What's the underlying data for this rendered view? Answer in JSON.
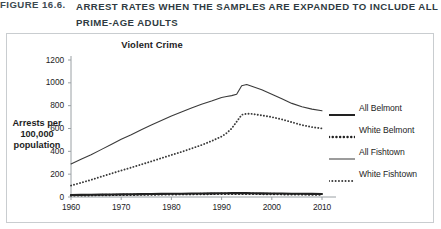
{
  "caption": {
    "label": "FIGURE 16.6.",
    "text": "ARREST RATES WHEN THE SAMPLES ARE EXPANDED TO INCLUDE ALL PRIME-AGE ADULTS"
  },
  "chart_data": {
    "type": "line",
    "title": "Violent Crime",
    "xlabel": "",
    "ylabel": "Arrests per 100,000 population",
    "ylabel_lines": [
      "Arrests per",
      "100,000",
      "population"
    ],
    "xlim": [
      1960,
      2010
    ],
    "ylim": [
      0,
      1200
    ],
    "yticks": [
      0,
      200,
      400,
      600,
      800,
      1000,
      1200
    ],
    "xticks": [
      1960,
      1970,
      1980,
      1990,
      2000,
      2010
    ],
    "grid": false,
    "legend_position": "right",
    "x": [
      1960,
      1962,
      1964,
      1966,
      1968,
      1970,
      1972,
      1974,
      1976,
      1978,
      1980,
      1982,
      1984,
      1986,
      1988,
      1990,
      1991,
      1992,
      1993,
      1994,
      1995,
      1996,
      1998,
      2000,
      2002,
      2004,
      2006,
      2008,
      2010
    ],
    "series": [
      {
        "name": "All Belmont",
        "style": "solid",
        "width": "thick",
        "color": "#222222",
        "values": [
          18,
          19,
          20,
          21,
          22,
          23,
          24,
          25,
          26,
          27,
          28,
          29,
          30,
          31,
          32,
          33,
          33,
          34,
          34,
          34,
          34,
          33,
          32,
          31,
          30,
          29,
          28,
          27,
          26
        ]
      },
      {
        "name": "White Belmont",
        "style": "dotted",
        "width": "thick",
        "color": "#222222",
        "values": [
          14,
          15,
          16,
          17,
          18,
          19,
          20,
          21,
          22,
          23,
          24,
          25,
          25,
          26,
          27,
          28,
          28,
          28,
          29,
          29,
          29,
          28,
          27,
          26,
          25,
          24,
          23,
          22,
          21
        ]
      },
      {
        "name": "All Fishtown",
        "style": "solid",
        "width": "thin",
        "color": "#3a3a3a",
        "values": [
          290,
          330,
          370,
          415,
          460,
          505,
          545,
          590,
          630,
          670,
          710,
          745,
          780,
          812,
          840,
          872,
          880,
          888,
          900,
          975,
          985,
          970,
          940,
          900,
          860,
          820,
          790,
          770,
          755
        ]
      },
      {
        "name": "White Fishtown",
        "style": "dotted",
        "width": "thin",
        "color": "#3a3a3a",
        "values": [
          100,
          125,
          150,
          178,
          205,
          232,
          258,
          285,
          312,
          340,
          368,
          395,
          425,
          455,
          490,
          530,
          560,
          600,
          660,
          720,
          730,
          728,
          715,
          700,
          680,
          655,
          630,
          612,
          600
        ]
      }
    ]
  },
  "legend": {
    "items": [
      {
        "label": "All Belmont"
      },
      {
        "label": "White Belmont"
      },
      {
        "label": "All Fishtown"
      },
      {
        "label": "White Fishtown"
      }
    ]
  }
}
